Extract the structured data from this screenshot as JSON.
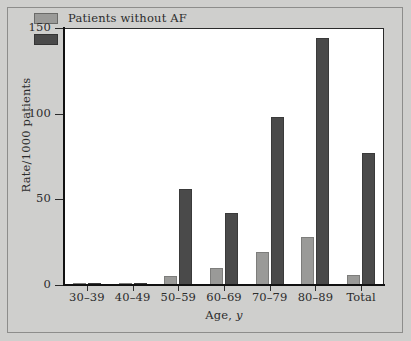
{
  "figure": {
    "background_color": "#cfcfcd",
    "plot_background_color": "#ffffff",
    "axis_color": "#111111"
  },
  "chart_data": {
    "type": "bar",
    "title": "",
    "subtitle": "",
    "xlabel": "Age, y",
    "xlabel_plain": "Age,",
    "xlabel_italic": "y",
    "ylabel": "Rate/1000 patients",
    "categories": [
      "30–39",
      "40–49",
      "50–59",
      "60–69",
      "70–79",
      "80–89",
      "Total"
    ],
    "ylim": [
      0,
      150
    ],
    "yticks": [
      0,
      50,
      100,
      150
    ],
    "ytick_labels": [
      "0",
      "50",
      "100",
      "150"
    ],
    "grid": false,
    "legend_position": "top-left",
    "series": [
      {
        "name": "Patients without AF",
        "color": "#9a9a98",
        "values": [
          1,
          1,
          5,
          10,
          19,
          28,
          6
        ]
      },
      {
        "name": "Patients with AF",
        "color": "#4a4a4a",
        "values": [
          1,
          1,
          56,
          42,
          98,
          144,
          77
        ]
      }
    ]
  },
  "legend": {
    "items": [
      {
        "label": "Patients without AF",
        "swatch": "light"
      },
      {
        "label": "Patients with AF",
        "swatch": "dark"
      }
    ]
  }
}
